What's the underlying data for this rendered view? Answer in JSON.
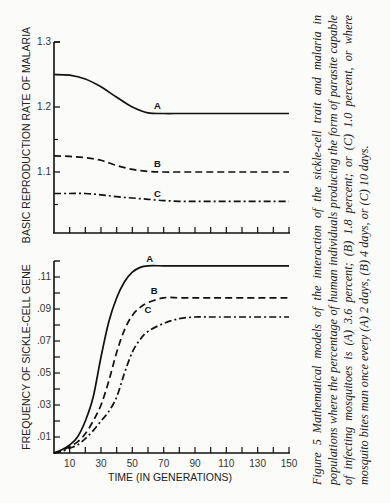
{
  "figure": {
    "caption_label": "Figure 5",
    "caption_text": "Mathematical models of the interaction of the sickle-cell trait and malaria in populations where the percentage of human individuals producing the form of parasite capable of infecting mosquitoes is (A) 3.6 percent; (B) 1.8 percent; or (C) 1.0 percent, or where mosquito bites man once every (A) 2 days, (B) 4 days, or (C) 10 days."
  },
  "chart_data": [
    {
      "type": "line",
      "title": "",
      "ylabel": "BASIC REPRODUCTION RATE OF MALARIA",
      "xlabel": "",
      "ylim": [
        1.0,
        1.3
      ],
      "xlim": [
        0,
        150
      ],
      "yticks": [
        "1.1",
        "1.2",
        "1.3"
      ],
      "grid": false,
      "legend": "inline curve labels",
      "x": [
        0,
        10,
        20,
        30,
        40,
        50,
        60,
        70,
        80,
        90,
        100,
        110,
        120,
        130,
        140,
        150
      ],
      "series": [
        {
          "name": "A",
          "style": "solid",
          "values": [
            1.25,
            1.249,
            1.243,
            1.231,
            1.215,
            1.2,
            1.191,
            1.19,
            1.19,
            1.19,
            1.19,
            1.19,
            1.19,
            1.19,
            1.19,
            1.19
          ]
        },
        {
          "name": "B",
          "style": "dashed",
          "values": [
            1.125,
            1.124,
            1.122,
            1.118,
            1.11,
            1.104,
            1.101,
            1.1,
            1.1,
            1.1,
            1.1,
            1.1,
            1.1,
            1.1,
            1.1,
            1.1
          ]
        },
        {
          "name": "C",
          "style": "dash-dot",
          "values": [
            1.067,
            1.067,
            1.067,
            1.065,
            1.062,
            1.06,
            1.058,
            1.056,
            1.055,
            1.055,
            1.055,
            1.055,
            1.055,
            1.055,
            1.055,
            1.055
          ]
        }
      ]
    },
    {
      "type": "line",
      "title": "",
      "ylabel": "FREQUENCY OF SICKLE-CELL GENE",
      "xlabel": "TIME (IN GENERATIONS)",
      "ylim": [
        0,
        0.12
      ],
      "xlim": [
        0,
        150
      ],
      "yticks": [
        ".01",
        ".03",
        ".05",
        ".07",
        ".09",
        ".11"
      ],
      "xticks": [
        "10",
        "30",
        "50",
        "70",
        "90",
        "110",
        "130",
        "150"
      ],
      "grid": false,
      "legend": "inline curve labels",
      "x": [
        0,
        5,
        10,
        15,
        20,
        25,
        30,
        35,
        40,
        45,
        50,
        55,
        60,
        70,
        80,
        90,
        100,
        150
      ],
      "series": [
        {
          "name": "A",
          "style": "solid",
          "values": [
            0.0,
            0.002,
            0.005,
            0.01,
            0.02,
            0.035,
            0.06,
            0.082,
            0.097,
            0.107,
            0.113,
            0.116,
            0.117,
            0.117,
            0.117,
            0.117,
            0.117,
            0.117
          ]
        },
        {
          "name": "B",
          "style": "dashed",
          "values": [
            0.0,
            0.0015,
            0.004,
            0.007,
            0.012,
            0.02,
            0.03,
            0.045,
            0.063,
            0.077,
            0.086,
            0.091,
            0.094,
            0.097,
            0.097,
            0.097,
            0.097,
            0.097
          ]
        },
        {
          "name": "C",
          "style": "dash-dot",
          "values": [
            0.0,
            0.001,
            0.003,
            0.005,
            0.009,
            0.014,
            0.02,
            0.026,
            0.035,
            0.05,
            0.063,
            0.071,
            0.076,
            0.081,
            0.084,
            0.085,
            0.085,
            0.085
          ]
        }
      ]
    }
  ]
}
